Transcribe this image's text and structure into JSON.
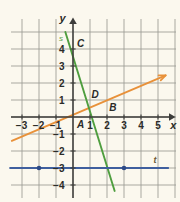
{
  "figure": {
    "background_color": "#fbf8ee",
    "grid_color": "#9a9a93",
    "axis_color": "#3c3c3a",
    "top_fragment_text": "……………"
  },
  "axes": {
    "x_axis_label": "x",
    "y_axis_label": "y",
    "x_label_color": "#2b2b28",
    "y_label_color": "#2b2b28",
    "x_ticks": [
      {
        "value": -3,
        "label": "−3"
      },
      {
        "value": -2,
        "label": "−2"
      },
      {
        "value": -1,
        "label": "−1"
      },
      {
        "value": 1,
        "label": "1"
      },
      {
        "value": 2,
        "label": "2"
      },
      {
        "value": 3,
        "label": "3"
      },
      {
        "value": 4,
        "label": "4"
      },
      {
        "value": 5,
        "label": "5"
      }
    ],
    "y_ticks": [
      {
        "value": 4,
        "label": "4"
      },
      {
        "value": 3,
        "label": "3"
      },
      {
        "value": 2,
        "label": "2"
      },
      {
        "value": 1,
        "label": "1"
      },
      {
        "value": -1,
        "label": "−1"
      },
      {
        "value": -2,
        "label": "−2"
      },
      {
        "value": -3,
        "label": "−3"
      },
      {
        "value": -4,
        "label": "−4"
      }
    ],
    "xlim": [
      -3.9,
      6.0
    ],
    "ylim": [
      -4.8,
      5.3
    ],
    "grid": true
  },
  "chart_data": {
    "type": "line",
    "title": "",
    "xlabel": "x",
    "ylabel": "y",
    "xlim": [
      -3.9,
      6.0
    ],
    "ylim": [
      -4.8,
      5.3
    ],
    "grid": true,
    "series": [
      {
        "name": "orange-line",
        "label": "",
        "color": "#e8913a",
        "type": "line",
        "arrow_end": true,
        "points": [
          {
            "x": -3.6,
            "y": -1.4
          },
          {
            "x": 5.45,
            "y": 2.45
          }
        ],
        "slope": 0.43,
        "intercept": 0.15
      },
      {
        "name": "line-s",
        "label": "s",
        "label_color": "#5aa04a",
        "color": "#4f9e3f",
        "type": "line",
        "points": [
          {
            "x": -0.45,
            "y": 5.0
          },
          {
            "x": 2.45,
            "y": -4.35
          }
        ],
        "slope": -3.22,
        "intercept": 3.55
      },
      {
        "name": "line-t",
        "label": "t",
        "label_color": "#6b5a36",
        "color": "#3f5f9e",
        "type": "line",
        "constant_y": -3,
        "points": [
          {
            "x": -3.7,
            "y": -3
          },
          {
            "x": 5.6,
            "y": -3
          }
        ]
      }
    ],
    "labeled_points": [
      {
        "name": "A",
        "label": "A",
        "x": 0.45,
        "y": -0.45,
        "color": "#2b2b28",
        "marker": false
      },
      {
        "name": "B",
        "label": "B",
        "x": 2.35,
        "y": 0.55,
        "color": "#2b2b28",
        "marker": false
      },
      {
        "name": "C",
        "label": "C",
        "x": 0.45,
        "y": 4.3,
        "color": "#2b2b28",
        "marker": false
      },
      {
        "name": "D",
        "label": "D",
        "x": 1.3,
        "y": 1.3,
        "color": "#2b2b28",
        "marker": false
      }
    ],
    "markers": [
      {
        "name": "point-on-t-left",
        "x": -2,
        "y": -3,
        "color": "#2d4a86"
      },
      {
        "name": "point-on-t-right",
        "x": 3,
        "y": -3,
        "color": "#2d4a86"
      }
    ]
  }
}
